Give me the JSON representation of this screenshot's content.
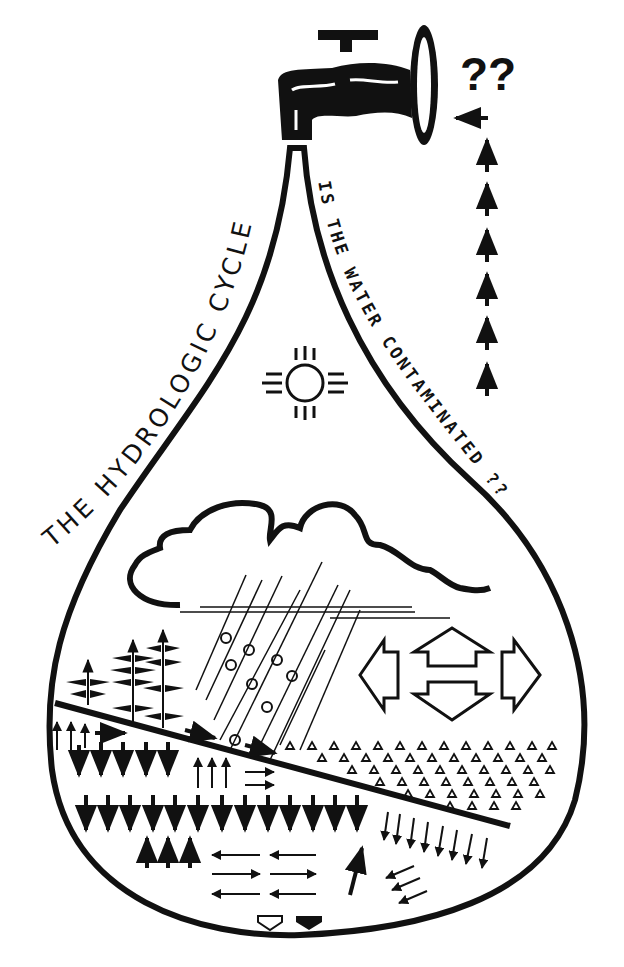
{
  "diagram": {
    "title": "THE HYDROLOGIC CYCLE",
    "question": "IS THE WATER CONTAMINATED ??",
    "faucet_marks": "??",
    "colors": {
      "ink": "#111111",
      "background": "#ffffff"
    },
    "elements": [
      {
        "name": "faucet",
        "icon": "faucet-icon"
      },
      {
        "name": "water-drop-outline",
        "icon": "drop-icon"
      },
      {
        "name": "sun",
        "icon": "zia-sun-icon"
      },
      {
        "name": "cloud",
        "icon": "cloud-icon"
      },
      {
        "name": "rain",
        "icon": "rain-lines-icon"
      },
      {
        "name": "trees",
        "icon": "tree-arrows-icon",
        "count": 3
      },
      {
        "name": "wind-directions",
        "icon": "four-way-hollow-arrows-icon"
      },
      {
        "name": "land-surface",
        "icon": "sloped-line"
      },
      {
        "name": "rock-aggregate",
        "icon": "triangle-pattern-icon"
      },
      {
        "name": "infiltration-arrows",
        "icon": "down-arrow-icon"
      },
      {
        "name": "groundwater-flow-arrows",
        "icon": "horizontal-arrow-icon"
      },
      {
        "name": "pumping-arrows",
        "icon": "dashed-up-arrow-icon"
      }
    ]
  }
}
